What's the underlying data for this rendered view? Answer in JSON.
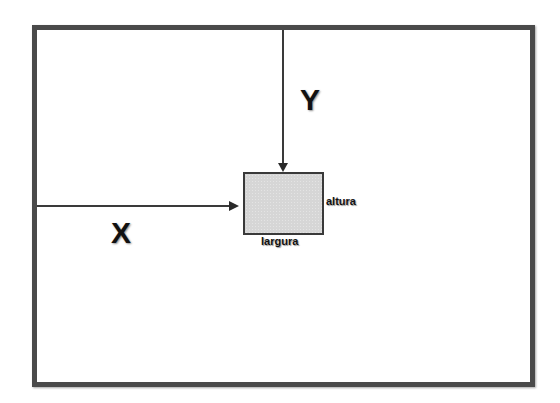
{
  "diagram": {
    "axis_labels": {
      "x": "X",
      "y": "Y"
    },
    "box_labels": {
      "height": "altura",
      "width": "largura"
    },
    "colors": {
      "frame_border": "#4a4a4a",
      "arrow": "#3a3a3a",
      "box_fill": "#d6d6d6",
      "box_border": "#3a3a3a",
      "text": "#111111",
      "background": "#ffffff"
    }
  }
}
